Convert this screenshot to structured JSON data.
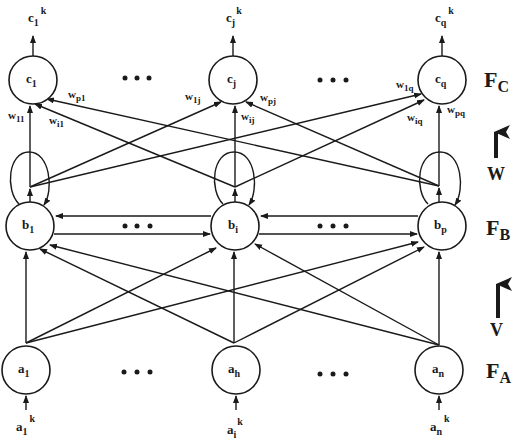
{
  "layers": {
    "FC": {
      "label": "F",
      "sub": "C"
    },
    "FB": {
      "label": "F",
      "sub": "B"
    },
    "FA": {
      "label": "F",
      "sub": "A"
    }
  },
  "matrices": {
    "W": "W",
    "V": "V"
  },
  "nodes": {
    "c1": {
      "main": "c",
      "sub": "1"
    },
    "cj": {
      "main": "c",
      "sub": "j"
    },
    "cq": {
      "main": "c",
      "sub": "q"
    },
    "b1": {
      "main": "b",
      "sub": "1"
    },
    "bi": {
      "main": "b",
      "sub": "i"
    },
    "bp": {
      "main": "b",
      "sub": "p"
    },
    "a1": {
      "main": "a",
      "sub": "1"
    },
    "ah": {
      "main": "a",
      "sub": "h"
    },
    "an": {
      "main": "a",
      "sub": "n"
    }
  },
  "outputs": {
    "c1k": {
      "main": "c",
      "sub": "1",
      "sup": "k"
    },
    "cjk": {
      "main": "c",
      "sub": "j",
      "sup": "k"
    },
    "cqk": {
      "main": "c",
      "sub": "q",
      "sup": "k"
    }
  },
  "inputs": {
    "a1k": {
      "main": "a",
      "sub": "1",
      "sup": "k"
    },
    "aik": {
      "main": "a",
      "sub": "i",
      "sup": "k"
    },
    "ank": {
      "main": "a",
      "sub": "n",
      "sup": "k"
    }
  },
  "weights": {
    "w11": {
      "main": "w",
      "sub": "11"
    },
    "wi1": {
      "main": "w",
      "sub": "i1"
    },
    "wp1": {
      "main": "w",
      "sub": "p1"
    },
    "w1j": {
      "main": "w",
      "sub": "1j"
    },
    "wij": {
      "main": "w",
      "sub": "ij"
    },
    "wpj": {
      "main": "w",
      "sub": "pj"
    },
    "w1q": {
      "main": "w",
      "sub": "1q"
    },
    "wiq": {
      "main": "w",
      "sub": "iq"
    },
    "wpq": {
      "main": "w",
      "sub": "pq"
    }
  },
  "ellipsis": "• • •",
  "colors": {
    "stroke": "#1a1a1a",
    "background": "#ffffff"
  }
}
